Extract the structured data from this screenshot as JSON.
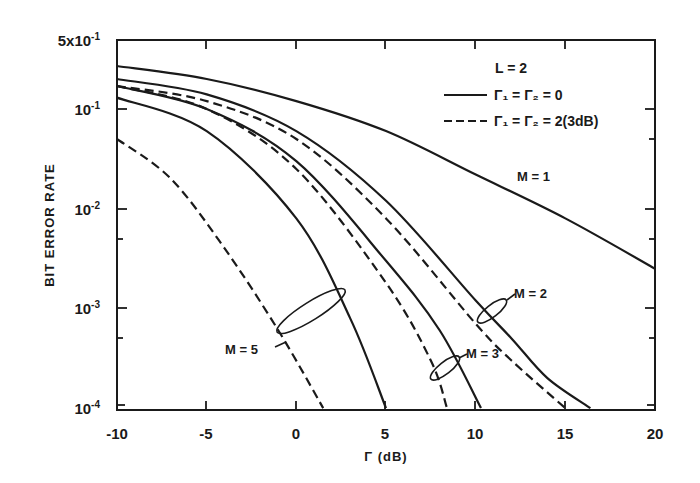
{
  "chart_data": {
    "type": "line",
    "title": "",
    "xlabel": "Γ (dB)",
    "ylabel": "BIT ERROR RATE",
    "xlim": [
      -10,
      20
    ],
    "ylim": [
      0.0001,
      0.5
    ],
    "yscale": "log",
    "grid": false,
    "x_ticks": [
      "-10",
      "-5",
      "0",
      "5",
      "10",
      "15",
      "20"
    ],
    "y_ticks": [
      {
        "label": "5x10",
        "exp": "-1",
        "value": 0.5
      },
      {
        "label": "10",
        "exp": "-1",
        "value": 0.1
      },
      {
        "label": "10",
        "exp": "-2",
        "value": 0.01
      },
      {
        "label": "10",
        "exp": "-3",
        "value": 0.001
      },
      {
        "label": "10",
        "exp": "-4",
        "value": 0.0001
      }
    ],
    "legend": {
      "title": "L = 2",
      "entries": [
        {
          "style": "solid",
          "label": "Γ1 = Γ2 = 0"
        },
        {
          "style": "dashed",
          "label": "Γ1 = Γ2 = 2(3dB)"
        }
      ],
      "position": "upper right"
    },
    "series": [
      {
        "name": "M=1, Γ1=Γ2=0",
        "style": "solid",
        "x": [
          -10,
          -5,
          0,
          5,
          10,
          15,
          20
        ],
        "y": [
          0.27,
          0.2,
          0.12,
          0.06,
          0.022,
          0.008,
          0.0025
        ]
      },
      {
        "name": "M=2, Γ1=Γ2=0",
        "style": "solid",
        "x": [
          -10,
          -5,
          0,
          5,
          10,
          12,
          14,
          16.4
        ],
        "y": [
          0.2,
          0.14,
          0.06,
          0.012,
          0.0012,
          0.0005,
          0.0002,
          0.0001
        ]
      },
      {
        "name": "M=2, Γ1=Γ2=2(3dB)",
        "style": "dashed",
        "x": [
          -10,
          -5,
          0,
          5,
          10,
          12,
          15
        ],
        "y": [
          0.17,
          0.12,
          0.05,
          0.008,
          0.0007,
          0.0003,
          0.0001
        ]
      },
      {
        "name": "M=3, Γ1=Γ2=0",
        "style": "solid",
        "x": [
          -10,
          -5,
          0,
          5,
          8,
          10.3
        ],
        "y": [
          0.17,
          0.1,
          0.03,
          0.003,
          0.0006,
          0.0001
        ]
      },
      {
        "name": "M=3, Γ1=Γ2=2(3dB)",
        "style": "dashed",
        "x": [
          -10,
          -5,
          0,
          5,
          7.5,
          8.4
        ],
        "y": [
          0.17,
          0.1,
          0.025,
          0.0018,
          0.0003,
          0.0001
        ]
      },
      {
        "name": "M=5, Γ1=Γ2=0",
        "style": "solid",
        "x": [
          -10,
          -5,
          0,
          3,
          5
        ],
        "y": [
          0.13,
          0.06,
          0.008,
          0.0008,
          0.0001
        ]
      },
      {
        "name": "M=5, Γ1=Γ2=2(3dB)",
        "style": "dashed",
        "x": [
          -10,
          -7,
          -4,
          -1,
          1.5
        ],
        "y": [
          0.05,
          0.02,
          0.004,
          0.0006,
          0.0001
        ]
      }
    ],
    "annotations": [
      {
        "text": "M = 1",
        "x": 12,
        "y": 0.02
      },
      {
        "text": "M = 2",
        "x": 12.5,
        "y": 0.0015
      },
      {
        "text": "M = 3",
        "x": 10,
        "y": 0.0004
      },
      {
        "text": "M = 5",
        "x": -3.5,
        "y": 0.0003
      }
    ]
  },
  "labels": {
    "ytick_5e1_base": "5x10",
    "ytick_5e1_exp": "-1",
    "ytick_1e1_base": "10",
    "ytick_1e1_exp": "-1",
    "ytick_1e2_base": "10",
    "ytick_1e2_exp": "-2",
    "ytick_1e3_base": "10",
    "ytick_1e3_exp": "-3",
    "ytick_1e4_base": "10",
    "ytick_1e4_exp": "-4",
    "x0": "-10",
    "x1": "-5",
    "x2": "0",
    "x3": "5",
    "x4": "10",
    "x5": "15",
    "x6": "20",
    "xlabel": "Γ (dB)",
    "ylabel": "BIT ERROR RATE",
    "legend_title": "L = 2",
    "legend_solid": "Γ₁ = Γ₂ = 0",
    "legend_dashed": "Γ₁ = Γ₂ = 2(3dB)",
    "m1": "M = 1",
    "m2": "M = 2",
    "m3": "M = 3",
    "m5": "M = 5"
  }
}
